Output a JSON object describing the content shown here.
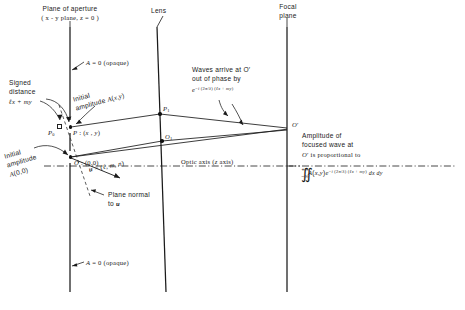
{
  "figure": {
    "title_plane_aperture_l1": "Plane of aperture",
    "title_plane_aperture_l2": "( x - y  plane,  z = 0 )",
    "title_lens": "Lens",
    "title_focal_l1": "Focal",
    "title_focal_l2": "plane",
    "opaque_top": "A = 0 (opaque)",
    "opaque_bottom": "A = 0 (opaque)",
    "signed_distance_l1": "Signed",
    "signed_distance_l2": "distance",
    "signed_distance_l3": "ℓx + my",
    "initial_amplitude_Pxy_l1": "Initial",
    "initial_amplitude_Pxy_l2": "amplitude A(x,y)",
    "initial_amplitude_O_l1": "Initial",
    "initial_amplitude_O_l2": "amplitude",
    "initial_amplitude_O_l3": "A(0,0)",
    "point_P0": "P0",
    "point_P": "P : (x , y)",
    "point_P1": "P1",
    "point_O1": "O1",
    "point_O": "O : (0,0)",
    "point_Oprime": "O′",
    "vector_u": "u = (ℓ, m, n)",
    "plane_normal_l1": "Plane normal",
    "plane_normal_l2": "to u",
    "optic_axis": "Optic axis (z axis)",
    "waves_l1": "Waves arrive at O′",
    "waves_l2": "out of phase by",
    "waves_l3": "e −i (2π/λ) (ℓx + my)",
    "amplitude_l1": "Amplitude of",
    "amplitude_l2": "focused wave at",
    "amplitude_l3": "O′ is proportional to",
    "integral_upper": "+∞",
    "integral_lower": "−∞",
    "integral_symbol": "∬",
    "integral_body": "A(x,y) e −i (2π/λ) (ℓx + my)",
    "integral_tail": "dx  dy"
  },
  "colors": {
    "line": "#1a1a1a",
    "text": "#1a1a1a",
    "background": "#ffffff"
  }
}
